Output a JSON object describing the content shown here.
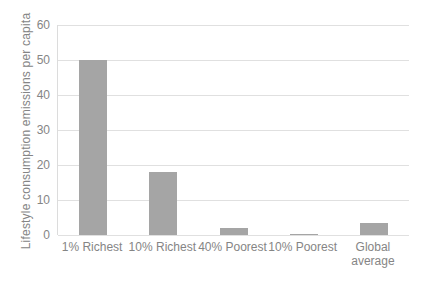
{
  "chart_data": {
    "type": "bar",
    "categories": [
      "1% Richest",
      "10% Richest",
      "40% Poorest",
      "10% Poorest",
      "Global average"
    ],
    "values": [
      50,
      18,
      2,
      0.2,
      3.5
    ],
    "ylabel": "Lifestyle consumption emissions per capita",
    "ylim": [
      0,
      60
    ],
    "yticks": [
      0,
      10,
      20,
      30,
      40,
      50,
      60
    ],
    "grid": "horizontal",
    "legend": "none",
    "bar_color": "#a5a5a5",
    "gridline_color": "#e0e0e0",
    "axis_text_color": "#858585",
    "background_color": "#ffffff"
  }
}
